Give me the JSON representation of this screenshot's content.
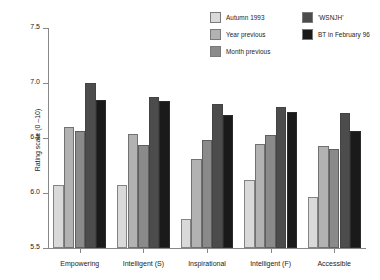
{
  "chart_data": {
    "type": "bar",
    "title": "",
    "xlabel": "",
    "ylabel": "Rating scale (0 –10)",
    "ylim": [
      5.5,
      7.5
    ],
    "yticks": [
      "5.5",
      "6.0",
      "6.5",
      "7.0",
      "7.5"
    ],
    "ytick_values": [
      5.5,
      6.0,
      6.5,
      7.0,
      7.5
    ],
    "grid": false,
    "legend_position": "top-right",
    "categories": [
      "Empowering",
      "Intelligent (S)",
      "Inspirational",
      "Intelligent (F)",
      "Accessible"
    ],
    "series": [
      {
        "name": "Autumn 1993",
        "color": "#d9d9d9",
        "values": [
          6.07,
          6.07,
          5.76,
          6.12,
          5.96
        ]
      },
      {
        "name": "Year previous",
        "color": "#b2b2b2",
        "values": [
          6.6,
          6.54,
          6.31,
          6.45,
          6.43
        ]
      },
      {
        "name": "Month previous",
        "color": "#8a8a8a",
        "values": [
          6.56,
          6.44,
          6.48,
          6.53,
          6.4
        ]
      },
      {
        "name": "'WSNJH'",
        "color": "#4c4c4c",
        "values": [
          7.0,
          6.87,
          6.81,
          6.78,
          6.73
        ]
      },
      {
        "name": "BT in February 96",
        "color": "#1a1a1a",
        "values": [
          6.85,
          6.84,
          6.71,
          6.74,
          6.56
        ]
      }
    ]
  },
  "legend": {
    "columns": [
      {
        "items": [
          0,
          1,
          2
        ]
      },
      {
        "items": [
          3,
          4
        ]
      }
    ]
  },
  "colors": {
    "axis": "#888888",
    "text": "#1c1c1c",
    "background": "#ffffff",
    "series_1": "#d9d9d9",
    "series_2": "#b2b2b2",
    "series_3": "#8a8a8a",
    "series_4": "#4c4c4c",
    "series_5": "#1a1a1a"
  }
}
